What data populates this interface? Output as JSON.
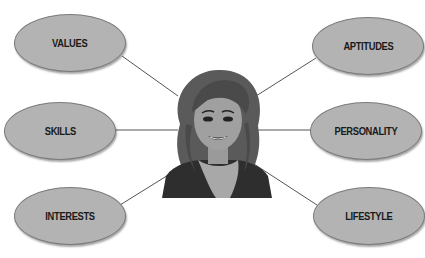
{
  "diagram": {
    "center": {
      "label": "",
      "icon": "woman-portrait"
    },
    "nodes": [
      {
        "id": "values",
        "label": "VALUES"
      },
      {
        "id": "aptitudes",
        "label": "APTITUDES"
      },
      {
        "id": "skills",
        "label": "SKILLS"
      },
      {
        "id": "personality",
        "label": "PERSONALITY"
      },
      {
        "id": "interests",
        "label": "INTERESTS"
      },
      {
        "id": "lifestyle",
        "label": "LIFESTYLE"
      }
    ],
    "colors": {
      "node_fill": "#b3b3b3",
      "node_border": "#7a7a7a",
      "connector": "#555555",
      "text": "#1a1a1a"
    }
  }
}
